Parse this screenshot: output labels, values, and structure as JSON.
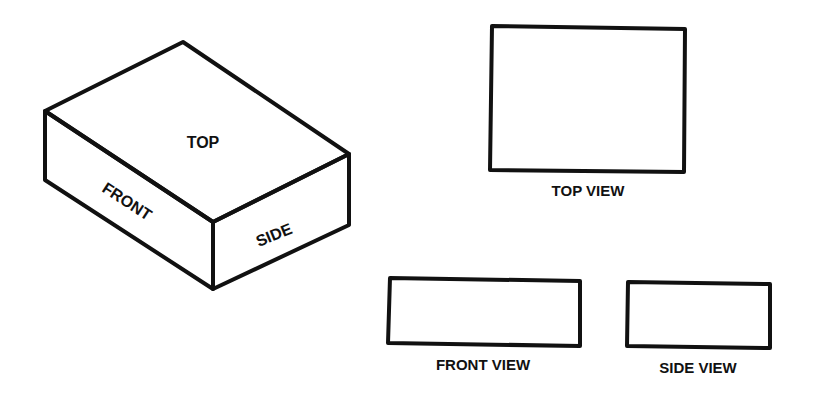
{
  "diagram": {
    "stroke_color": "#111111",
    "background": "#ffffff",
    "isometric_box": {
      "faces": {
        "top": "TOP",
        "front": "FRONT",
        "side": "SIDE"
      }
    },
    "views": {
      "top": "TOP VIEW",
      "front": "FRONT VIEW",
      "side": "SIDE VIEW"
    }
  }
}
